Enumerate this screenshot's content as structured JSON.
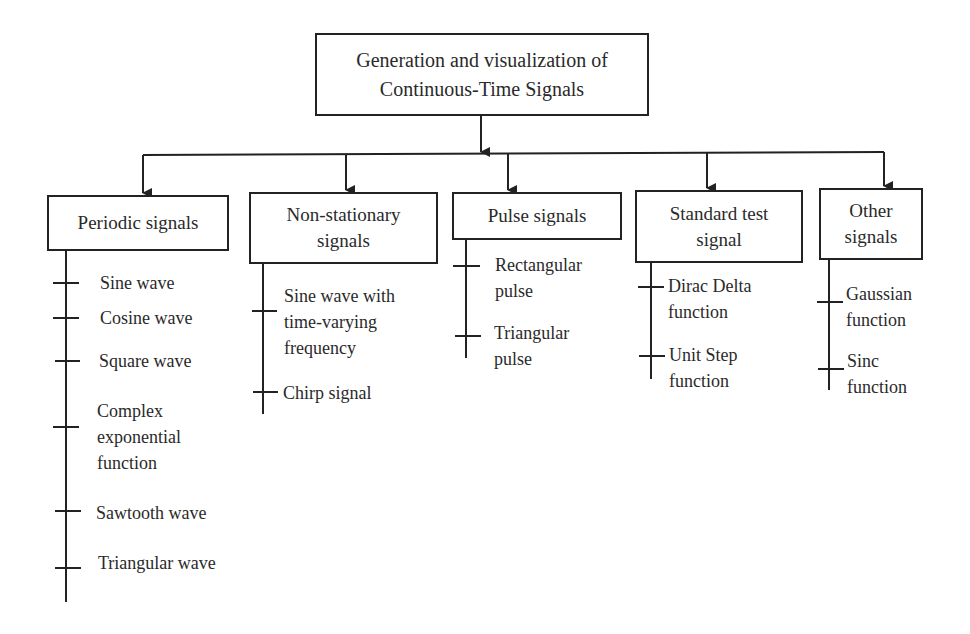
{
  "root": {
    "title": "Generation and visualization of\nContinuous-Time Signals"
  },
  "categories": [
    {
      "label": "Periodic signals",
      "items": [
        "Sine wave",
        "Cosine wave",
        "Square wave",
        "Complex\nexponential\nfunction",
        "Sawtooth wave",
        "Triangular wave"
      ]
    },
    {
      "label": "Non-stationary\nsignals",
      "items": [
        "Sine wave with\ntime-varying\nfrequency",
        "Chirp signal"
      ]
    },
    {
      "label": "Pulse signals",
      "items": [
        "Rectangular\npulse",
        "Triangular\npulse"
      ]
    },
    {
      "label": "Standard test\nsignal",
      "items": [
        "Dirac Delta\nfunction",
        "Unit Step\nfunction"
      ]
    },
    {
      "label": "Other\nsignals",
      "items": [
        "Gaussian\nfunction",
        "Sinc\nfunction"
      ]
    }
  ],
  "colors": {
    "line": "#222222",
    "text": "#2a2a2a",
    "background": "#ffffff"
  }
}
